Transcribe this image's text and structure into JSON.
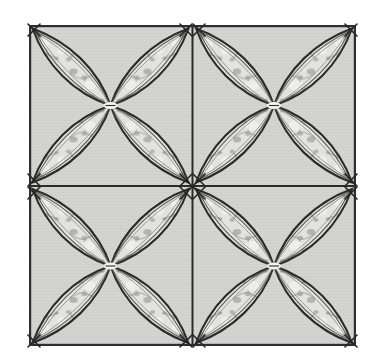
{
  "artwork": {
    "title": "Four-Block Orange Peel Quilt Pattern",
    "subject": "quilted fabric panel with four-petal flower motifs",
    "medium": "printed cotton fabric with machine quilting stitch lines",
    "layout": "2 x 2 grid of square blocks",
    "block_count": 4,
    "petals_per_block": 4,
    "petal_shape": "vesica / pointed-oval leaf",
    "outline_style": "triple concentric stitch lines",
    "corner_marks": "X-shaped cross stitches at every block corner",
    "background_texture": "fine horizontal woven weave",
    "petal_print": "mottled gray floral vine print"
  },
  "canvas": {
    "width": 380,
    "height": 361,
    "background_color": "#ffffff"
  },
  "frame": {
    "left": 29,
    "top": 25,
    "right": 356,
    "bottom": 346,
    "border_color": "#2e2e2e",
    "border_width": 2.2,
    "fill_color": "#d3d3d1"
  },
  "grid": {
    "columns": 2,
    "rows": 2,
    "vertical_divider_x": 192.5,
    "horizontal_divider_y": 186,
    "divider_color": "#2b2b2b",
    "divider_width": 2.0,
    "cell_width": 163.5,
    "cell_height": 160.5
  },
  "colors": {
    "fabric_ground": "#d3d3d1",
    "fabric_ground_light": "#dedede",
    "stitch_dark": "#2b2b2b",
    "stitch_mid": "#5a5a5a",
    "stitch_light": "#8f8f8f",
    "petal_fill": "#dcdcda",
    "petal_highlight": "#f1f1ef",
    "print_motif": "#9e9e9c",
    "print_motif_soft": "#b6b6b4",
    "page_background": "#ffffff"
  },
  "blocks": [
    {
      "id": "block-top-left",
      "row": 0,
      "col": 0,
      "cx": 110.5,
      "cy": 105.5
    },
    {
      "id": "block-top-right",
      "row": 0,
      "col": 1,
      "cx": 274.0,
      "cy": 105.5
    },
    {
      "id": "block-bottom-left",
      "row": 1,
      "col": 0,
      "cx": 110.5,
      "cy": 266.0
    },
    {
      "id": "block-bottom-right",
      "row": 1,
      "col": 1,
      "cx": 274.0,
      "cy": 266.0
    }
  ],
  "corner_marks": [
    {
      "x": 33,
      "y": 29
    },
    {
      "x": 192.5,
      "y": 29
    },
    {
      "x": 352,
      "y": 29
    },
    {
      "x": 33,
      "y": 186
    },
    {
      "x": 186,
      "y": 186
    },
    {
      "x": 199,
      "y": 186
    },
    {
      "x": 352,
      "y": 186
    },
    {
      "x": 33,
      "y": 342
    },
    {
      "x": 186,
      "y": 342
    },
    {
      "x": 199,
      "y": 342
    },
    {
      "x": 352,
      "y": 342
    }
  ]
}
